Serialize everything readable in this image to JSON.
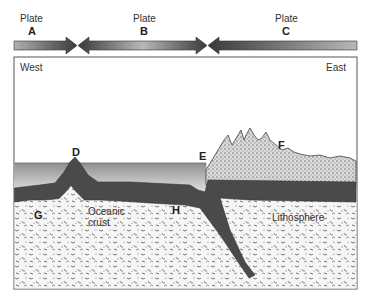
{
  "plates": [
    {
      "label": "Plate",
      "letter": "A"
    },
    {
      "label": "Plate",
      "letter": "B"
    },
    {
      "label": "Plate",
      "letter": "C"
    }
  ],
  "directions": {
    "west": "West",
    "east": "East"
  },
  "markers": {
    "D": "D",
    "E": "E",
    "F": "F",
    "G": "G",
    "H": "H"
  },
  "regions": {
    "oceanic_crust_line1": "Oceanic",
    "oceanic_crust_line2": "crust",
    "lithosphere": "Lithosphere"
  },
  "colors": {
    "arrow_dark": "#3a3a3a",
    "arrow_light": "#b8b8b8",
    "water_top": "#9a9a9a",
    "water_bottom": "#e0e0e0",
    "plate_dark": "#4a4a4a",
    "continent_speckle": "#bdbdbd",
    "mantle_bg": "#f4f4f4"
  }
}
